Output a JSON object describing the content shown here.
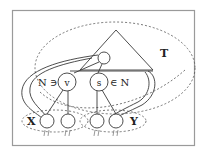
{
  "diagram": {
    "tree_label": "T",
    "left_node_label": "v",
    "right_node_label": "s",
    "left_relation": "N ∋",
    "right_relation": "∈ N",
    "left_set_label": "X",
    "right_set_label": "Y",
    "colors": {
      "stroke": "#3a3a3a",
      "dashed": "#555555",
      "frame": "#9a9a9a",
      "background": "#ffffff"
    }
  }
}
